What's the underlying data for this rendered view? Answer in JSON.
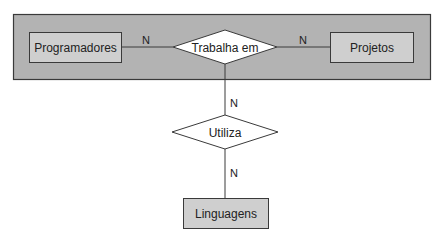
{
  "diagram": {
    "type": "entity-relationship",
    "colors": {
      "aggregation_fill": "#b3b3b3",
      "entity_fill": "#cfcfcf",
      "relationship_fill": "#ffffff",
      "stroke": "#3a3a3a"
    },
    "aggregation": {
      "label": ""
    },
    "entities": [
      {
        "id": "programadores",
        "label": "Programadores"
      },
      {
        "id": "projetos",
        "label": "Projetos"
      },
      {
        "id": "linguagens",
        "label": "Linguagens"
      }
    ],
    "relationships": [
      {
        "id": "trabalha_em",
        "label": "Trabalha em"
      },
      {
        "id": "utiliza",
        "label": "Utiliza"
      }
    ],
    "cardinalities": [
      {
        "between": "programadores-trabalha_em",
        "label": "N"
      },
      {
        "between": "trabalha_em-projetos",
        "label": "N"
      },
      {
        "between": "aggregation-utiliza",
        "label": "N"
      },
      {
        "between": "utiliza-linguagens",
        "label": "N"
      }
    ]
  }
}
